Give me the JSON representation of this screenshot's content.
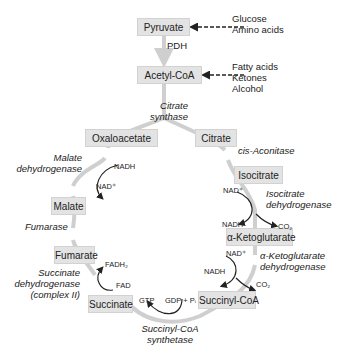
{
  "diagram": {
    "colors": {
      "box_fill": "#e3e3e3",
      "cycle_arrow": "#cfcfcf",
      "text": "#222222"
    },
    "inputs": {
      "pyruvate_sources": [
        "Glucose",
        "Amino acids"
      ],
      "acetyl_coa_sources": [
        "Fatty acids",
        "Ketones",
        "Alcohol"
      ]
    },
    "entry": {
      "pyruvate": "Pyruvate",
      "pdh": "PDH",
      "acetyl_coa": "Acetyl-CoA",
      "citrate_synthase": [
        "Citrate",
        "synthase"
      ]
    },
    "metabolites": {
      "oxaloacetate": "Oxaloacetate",
      "citrate": "Citrate",
      "isocitrate": "Isocitrate",
      "alpha_ketoglutarate": "α-Ketoglutarate",
      "succinyl_coa": "Succinyl-CoA",
      "succinate": "Succinate",
      "fumarate": "Fumarate",
      "malate": "Malate"
    },
    "enzymes": {
      "cis_aconitase": "cis-Aconitase",
      "isocitrate_dh": [
        "Isocitrate",
        "dehydrogenase"
      ],
      "akg_dh": [
        "α-Ketoglutarate",
        "dehydrogenase"
      ],
      "succinyl_coa_synthetase": [
        "Succinyl-CoA",
        "synthetase"
      ],
      "succinate_dh": [
        "Succinate",
        "dehydrogenase",
        "(complex II)"
      ],
      "fumarase": "Fumarase",
      "malate_dh": [
        "Malate",
        "dehydrogenase"
      ]
    },
    "cofactors": {
      "isocitrate": {
        "in": "NAD⁺",
        "out": "NADH",
        "co2": "CO₂"
      },
      "akg": {
        "in": "NAD⁺",
        "out": "NADH",
        "co2": "CO₂"
      },
      "succinyl": {
        "in": "GDP + Pᵢ",
        "out": "GTP"
      },
      "succinate": {
        "in": "FAD",
        "out": "FADH₂"
      },
      "malate": {
        "in": "NAD⁺",
        "out": "NADH"
      }
    }
  }
}
